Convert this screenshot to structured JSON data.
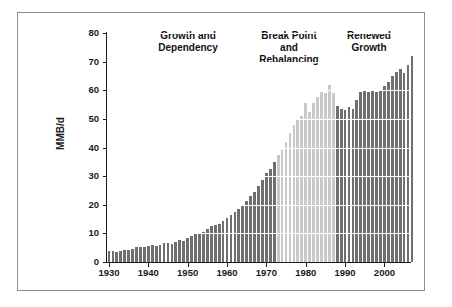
{
  "chart_data": {
    "type": "bar",
    "title": "",
    "subtitle": "",
    "xlabel": "",
    "ylabel": "MMB/d",
    "ylim": [
      0,
      80
    ],
    "xlim": [
      1929.5,
      2006.5
    ],
    "ytick_labels": [
      "0",
      "10",
      "20",
      "30",
      "40",
      "50",
      "60",
      "70",
      "80"
    ],
    "ytick_values": [
      0,
      10,
      20,
      30,
      40,
      50,
      60,
      70,
      80
    ],
    "xtick_labels": [
      "1930",
      "1940",
      "1950",
      "1960",
      "1970",
      "1980",
      "1990",
      "2000"
    ],
    "xtick_values": [
      1930,
      1940,
      1950,
      1960,
      1970,
      1980,
      1990,
      2000
    ],
    "grid": true,
    "grid_color": "#ffffff",
    "legend": "none",
    "colors": {
      "dark_bar": "#6f6f6f",
      "light_bar": "#c9c9c9",
      "axis": "#1a1a1a",
      "frame": "#8d8d8d",
      "background": "#ffffff",
      "text": "#111111"
    },
    "categories": [
      1930,
      1931,
      1932,
      1933,
      1934,
      1935,
      1936,
      1937,
      1938,
      1939,
      1940,
      1941,
      1942,
      1943,
      1944,
      1945,
      1946,
      1947,
      1948,
      1949,
      1950,
      1951,
      1952,
      1953,
      1954,
      1955,
      1956,
      1957,
      1958,
      1959,
      1960,
      1961,
      1962,
      1963,
      1964,
      1965,
      1966,
      1967,
      1968,
      1969,
      1970,
      1971,
      1972,
      1973,
      1974,
      1975,
      1976,
      1977,
      1978,
      1979,
      1980,
      1981,
      1982,
      1983,
      1984,
      1985,
      1986,
      1987,
      1988,
      1989,
      1990,
      1991,
      1992,
      1993,
      1994,
      1995,
      1996,
      1997,
      1998,
      1999,
      2000,
      2001,
      2002,
      2003,
      2004,
      2005,
      2006
    ],
    "values": [
      3.8,
      3.7,
      3.6,
      3.8,
      4.1,
      4.3,
      4.7,
      5.2,
      5.1,
      5.3,
      5.5,
      5.8,
      5.5,
      5.9,
      6.5,
      6.6,
      6.4,
      7.0,
      7.6,
      7.4,
      8.4,
      9.2,
      9.7,
      10.3,
      10.6,
      11.6,
      12.5,
      13.0,
      13.4,
      14.4,
      15.4,
      16.3,
      17.3,
      18.4,
      19.8,
      21.2,
      22.9,
      24.4,
      26.4,
      28.5,
      31.0,
      32.5,
      35.0,
      37.5,
      39.0,
      42.0,
      45.0,
      48.0,
      50.0,
      51.0,
      55.5,
      52.5,
      55.5,
      57.5,
      59.5,
      59.0,
      62.0,
      59.0,
      54.5,
      53.5,
      53.0,
      54.0,
      53.5,
      56.5,
      59.5,
      60.0,
      59.5,
      60.0,
      59.5,
      60.0,
      61.5,
      63.0,
      65.0,
      66.5,
      67.5,
      66.0,
      69.0
    ],
    "extra_values": [
      71.8
    ],
    "segments": [
      {
        "name": "Growth and Dependency",
        "start_year": 1930,
        "end_year": 1972,
        "color": "#6f6f6f"
      },
      {
        "name": "Break Point and Rebalancing",
        "start_year": 1973,
        "end_year": 1987,
        "color": "#c9c9c9"
      },
      {
        "name": "Renewed Growth",
        "start_year": 1988,
        "end_year": 2006,
        "color": "#6f6f6f"
      }
    ],
    "annotations": [
      {
        "id": "growth-dependency",
        "text": "Growth and\nDependency"
      },
      {
        "id": "break-point",
        "text": "Break Point\nand\nRebalancing"
      },
      {
        "id": "renewed-growth",
        "text": "Renewed\nGrowth"
      }
    ]
  }
}
